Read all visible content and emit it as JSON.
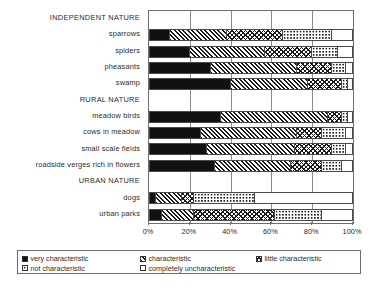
{
  "chart_data": {
    "type": "bar",
    "orientation": "horizontal",
    "stacked": true,
    "percent": true,
    "title": "",
    "xlabel": "",
    "ylabel": "",
    "xlim": [
      0,
      100
    ],
    "grid": true,
    "legend_position": "bottom",
    "xticks": [
      "0%",
      "20%",
      "40%",
      "60%",
      "80%",
      "100%"
    ],
    "xtick_values": [
      0,
      20,
      40,
      60,
      80,
      100
    ],
    "series": [
      {
        "name": "very characteristic",
        "pattern": "solid-black"
      },
      {
        "name": "characteristic",
        "pattern": "diagonal-hatch"
      },
      {
        "name": "little characteristic",
        "pattern": "cross-hatch"
      },
      {
        "name": "not characteristic",
        "pattern": "dots"
      },
      {
        "name": "completely uncharacteristic",
        "pattern": "white"
      }
    ],
    "groups": [
      {
        "label": "INDEPENDENT NATURE",
        "rows": [
          {
            "label": "sparrows",
            "values": [
              10,
              28,
              28,
              24,
              10
            ]
          },
          {
            "label": "spiders",
            "values": [
              20,
              37,
              23,
              13,
              7
            ]
          },
          {
            "label": "pheasants",
            "values": [
              30,
              43,
              17,
              7,
              3
            ]
          },
          {
            "label": "swamp",
            "values": [
              40,
              38,
              17,
              3,
              2
            ]
          }
        ]
      },
      {
        "label": "RURAL NATURE",
        "rows": [
          {
            "label": "meadow birds",
            "values": [
              35,
              53,
              7,
              3,
              2
            ]
          },
          {
            "label": "cows in meadow",
            "values": [
              25,
              48,
              12,
              12,
              3
            ]
          },
          {
            "label": "small scale fields",
            "values": [
              28,
              44,
              18,
              7,
              3
            ]
          },
          {
            "label": "roadside verges rich in flowers",
            "values": [
              32,
              38,
              15,
              10,
              5
            ]
          }
        ]
      },
      {
        "label": "URBAN NATURE",
        "rows": [
          {
            "label": "dogs",
            "values": [
              3,
              13,
              6,
              30,
              48
            ]
          },
          {
            "label": "urban parks",
            "values": [
              6,
              16,
              40,
              23,
              15
            ]
          }
        ]
      }
    ]
  },
  "legend": {
    "items": [
      {
        "label": "very characteristic",
        "pattern": "solid-black"
      },
      {
        "label": "characteristic",
        "pattern": "diagonal-hatch"
      },
      {
        "label": "little characteristic",
        "pattern": "cross-hatch"
      },
      {
        "label": "not characteristic",
        "pattern": "dots"
      },
      {
        "label": "completely uncharacteristic",
        "pattern": "white"
      }
    ]
  }
}
